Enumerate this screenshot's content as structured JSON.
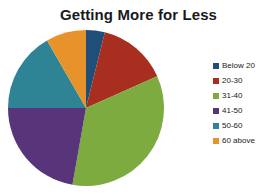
{
  "chart_data": {
    "type": "pie",
    "title": "Getting More for Less",
    "xlabel": "",
    "ylabel": "",
    "legend_position": "right",
    "grid": false,
    "categories": [
      "Below 20",
      "20-30",
      "31-40",
      "41-50",
      "50-60",
      "60 above"
    ],
    "values": [
      4,
      14,
      34,
      22,
      17,
      9
    ],
    "colors": [
      "#1f4e79",
      "#a82f20",
      "#7dab3f",
      "#58347a",
      "#2e8395",
      "#e8922b"
    ],
    "start_angle": 0,
    "direction": "clockwise",
    "slices": [
      {
        "label": "Below 20",
        "value": 4,
        "color": "#1f4e79",
        "start_deg": 0,
        "end_deg": 14
      },
      {
        "label": "20-30",
        "value": 14,
        "color": "#a82f20",
        "start_deg": 14,
        "end_deg": 66
      },
      {
        "label": "31-40",
        "value": 34,
        "color": "#7dab3f",
        "start_deg": 66,
        "end_deg": 190
      },
      {
        "label": "41-50",
        "value": 22,
        "color": "#58347a",
        "start_deg": 190,
        "end_deg": 270
      },
      {
        "label": "50-60",
        "value": 17,
        "color": "#2e8395",
        "start_deg": 270,
        "end_deg": 330
      },
      {
        "label": "60 above",
        "value": 9,
        "color": "#e8922b",
        "start_deg": 330,
        "end_deg": 360
      }
    ]
  },
  "legend": {
    "items": [
      {
        "label": "Below 20",
        "color": "#1f4e79"
      },
      {
        "label": "20-30",
        "color": "#a82f20"
      },
      {
        "label": "31-40",
        "color": "#7dab3f"
      },
      {
        "label": "41-50",
        "color": "#58347a"
      },
      {
        "label": "50-60",
        "color": "#2e8395"
      },
      {
        "label": "60 above",
        "color": "#e8922b"
      }
    ]
  }
}
